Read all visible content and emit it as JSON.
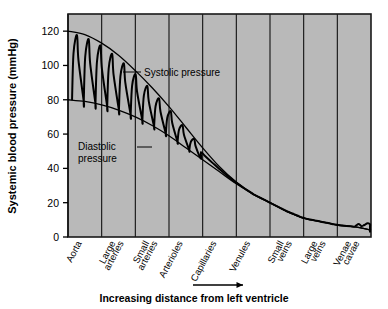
{
  "chart_data": {
    "type": "line",
    "title": "",
    "ylabel": "Systemic blood pressure (mmHg)",
    "xlabel": "Increasing distance from left ventricle",
    "ylim": [
      0,
      130
    ],
    "yticks": [
      0,
      20,
      40,
      60,
      80,
      100,
      120
    ],
    "ytick_labels": [
      "0",
      "20",
      "40",
      "60",
      "80",
      "100",
      "120"
    ],
    "grid": "vertical category dividers only",
    "legend": "none (inline annotations)",
    "categories": [
      "Aorta",
      "Large arteries",
      "Small arteries",
      "Arterioles",
      "Capillaries",
      "Venules",
      "Small veins",
      "Large veins",
      "Venae cavae"
    ],
    "annotations": [
      {
        "id": "systolic",
        "text": "Systolic pressure",
        "lines": [
          "Systolic pressure"
        ]
      },
      {
        "id": "diastolic",
        "text": "Diastolic pressure",
        "lines": [
          "Diastolic",
          "pressure"
        ]
      }
    ],
    "series": [
      {
        "name": "Systolic pressure",
        "x": [
          0,
          0.5,
          1.0,
          1.5,
          2.0,
          2.5,
          3.0,
          3.5,
          4.0,
          4.5,
          5.0,
          5.5,
          6.0,
          6.5,
          7.0,
          7.5,
          8.0,
          8.5,
          9.0
        ],
        "values": [
          120,
          118,
          113,
          106,
          97,
          87,
          76,
          64,
          52,
          41,
          32,
          25,
          20,
          15,
          11,
          9,
          7,
          6,
          4
        ]
      },
      {
        "name": "Diastolic pressure",
        "x": [
          0,
          0.5,
          1.0,
          1.5,
          2.0,
          2.5,
          3.0,
          3.5,
          4.0,
          4.5,
          5.0,
          5.5,
          6.0,
          6.5,
          7.0,
          7.5,
          8.0,
          8.5,
          9.0
        ],
        "values": [
          80,
          79,
          77,
          74,
          70,
          65,
          59,
          52,
          45,
          38,
          31,
          25,
          20,
          15,
          11,
          9,
          7,
          6,
          4
        ]
      },
      {
        "name": "Pulsatile pressure wave",
        "description": "Oscillating trace between systolic and diastolic envelopes, damping from aorta through arterioles; flat through capillaries and veins; small ripples in venae cavae",
        "peaks": [
          118,
          108,
          96,
          86,
          76,
          66,
          58,
          50,
          43,
          37,
          33
        ],
        "troughs": [
          80,
          78,
          74,
          70,
          64,
          58,
          52,
          46,
          40,
          35,
          31
        ]
      }
    ]
  },
  "figure": {
    "y_axis_title": "Systemic blood pressure (mmHg)",
    "x_axis_caption": "Increasing distance from left ventricle",
    "arrow": "right-arrow",
    "plot_bg_color": "#b9b9b9",
    "line_color": "#000000",
    "border_color": "#1a1a1a"
  }
}
